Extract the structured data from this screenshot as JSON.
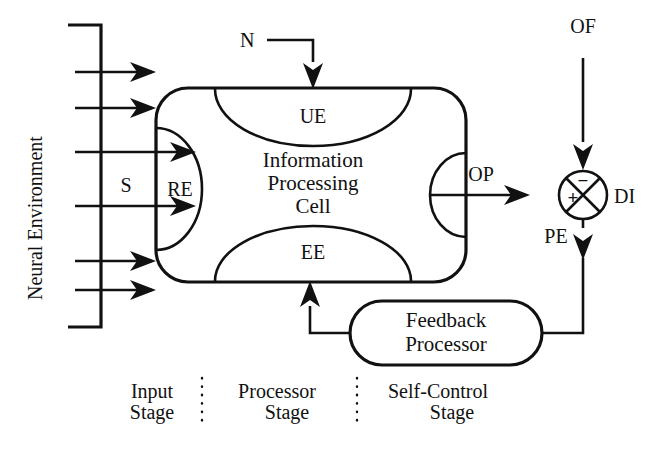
{
  "diagram": {
    "colors": {
      "ink": "#111111",
      "background": "#ffffff"
    },
    "environment": {
      "label": "Neural Environment",
      "input_count": 6
    },
    "cell": {
      "name": "Information Processing Cell",
      "line1": "Information",
      "line2": "Processing",
      "line3": "Cell",
      "ports": {
        "receptor": "RE",
        "upper": "UE",
        "lower": "EE",
        "stimulus": "S"
      }
    },
    "feedback": {
      "line1": "Feedback",
      "line2": "Processor"
    },
    "signals": {
      "neural_input": "N",
      "output": "OP",
      "outer_feedback": "OF",
      "desired_input": "DI",
      "process_error": "PE",
      "stimulus": "S"
    },
    "junction": {
      "plus": "+",
      "minus": "−",
      "output_label": "DI"
    },
    "stages": [
      {
        "line1": "Input",
        "line2": "Stage"
      },
      {
        "line1": "Processor",
        "line2": "Stage"
      },
      {
        "line1": "Self-Control",
        "line2": "Stage"
      }
    ]
  }
}
